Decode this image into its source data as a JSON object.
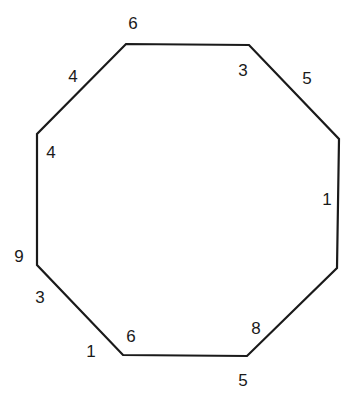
{
  "diagram": {
    "type": "octagon",
    "stroke_color": "#1a1a1a",
    "background": "#ffffff",
    "vertices": [
      {
        "x": 126,
        "y": 44
      },
      {
        "x": 249,
        "y": 45
      },
      {
        "x": 339,
        "y": 139
      },
      {
        "x": 337,
        "y": 268
      },
      {
        "x": 247,
        "y": 356
      },
      {
        "x": 123,
        "y": 355
      },
      {
        "x": 37,
        "y": 265
      },
      {
        "x": 37,
        "y": 134
      }
    ],
    "labels": [
      {
        "text": "6",
        "x": 133,
        "y": 29
      },
      {
        "text": "3",
        "x": 243,
        "y": 76
      },
      {
        "text": "5",
        "x": 307,
        "y": 84
      },
      {
        "text": "1",
        "x": 327,
        "y": 205
      },
      {
        "text": "8",
        "x": 256,
        "y": 334
      },
      {
        "text": "5",
        "x": 243,
        "y": 386
      },
      {
        "text": "6",
        "x": 131,
        "y": 342
      },
      {
        "text": "1",
        "x": 91,
        "y": 357
      },
      {
        "text": "3",
        "x": 40,
        "y": 303
      },
      {
        "text": "9",
        "x": 19,
        "y": 262
      },
      {
        "text": "4",
        "x": 51,
        "y": 158
      },
      {
        "text": "4",
        "x": 73,
        "y": 82
      }
    ]
  }
}
